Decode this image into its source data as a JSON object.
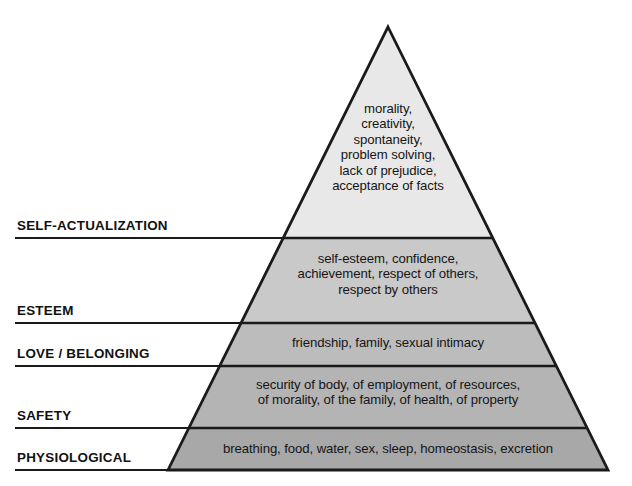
{
  "diagram": {
    "type": "pyramid",
    "geometry": {
      "apex_x": 388,
      "apex_y": 27,
      "base_left_x": 168,
      "base_right_x": 608,
      "base_y": 470,
      "divider_y": [
        238,
        323,
        366,
        428
      ],
      "label_rule_left_x": 15
    },
    "colors": {
      "outline": "#1a1a1a",
      "divider": "#1a1a1a",
      "rule": "#1a1a1a",
      "text": "#151515",
      "label_text": "#111111",
      "background": "#ffffff",
      "tier_fills": [
        "#e8e8e8",
        "#c9c9c9",
        "#bcbcbc",
        "#b4b4b4",
        "#a8a8a8"
      ]
    },
    "tiers": [
      {
        "id": "self-actualization",
        "label": "SELF-ACTUALIZATION",
        "fill": "#e8e8e8",
        "top_y": 27,
        "bottom_y": 238,
        "rule_y": 238,
        "label_y": 218,
        "items": [
          "morality,",
          "creativity,",
          "spontaneity,",
          "problem solving,",
          "lack of prejudice,",
          "acceptance of facts"
        ],
        "text": "morality,\ncreativity,\nspontaneity,\nproblem solving,\nlack of prejudice,\nacceptance of facts"
      },
      {
        "id": "esteem",
        "label": "ESTEEM",
        "fill": "#c9c9c9",
        "top_y": 238,
        "bottom_y": 323,
        "rule_y": 323,
        "label_y": 303,
        "items": [
          "self-esteem, confidence,",
          "achievement, respect of others,",
          "respect by others"
        ],
        "text": "self-esteem, confidence,\nachievement, respect of others,\nrespect by others"
      },
      {
        "id": "love-belonging",
        "label": "LOVE / BELONGING",
        "fill": "#bcbcbc",
        "top_y": 323,
        "bottom_y": 366,
        "rule_y": 366,
        "label_y": 346,
        "items": [
          "friendship, family, sexual intimacy"
        ],
        "text": "friendship, family, sexual intimacy"
      },
      {
        "id": "safety",
        "label": "SAFETY",
        "fill": "#b4b4b4",
        "top_y": 366,
        "bottom_y": 428,
        "rule_y": 428,
        "label_y": 408,
        "items": [
          "security of body, of employment, of resources,",
          "of morality, of the family, of health, of property"
        ],
        "text": "security of body, of employment, of resources,\nof morality, of the family, of health, of property"
      },
      {
        "id": "physiological",
        "label": "PHYSIOLOGICAL",
        "fill": "#a8a8a8",
        "top_y": 428,
        "bottom_y": 470,
        "rule_y": 470,
        "label_y": 450,
        "items": [
          "breathing, food, water, sex, sleep, homeostasis, excretion"
        ],
        "text": "breathing, food, water, sex, sleep, homeostasis, excretion"
      }
    ]
  }
}
